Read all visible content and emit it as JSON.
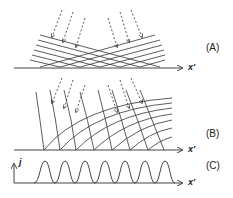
{
  "panels": [
    {
      "id": "A",
      "label": "(A)",
      "axis_label": "x'",
      "description": "Two families of straight crossing lines with incident dashed arrows"
    },
    {
      "id": "B",
      "label": "(B)",
      "axis_label": "x'",
      "description": "Curved wavefronts with incident dashed arrows"
    },
    {
      "id": "C",
      "label": "(C)",
      "axis_label": "x'",
      "y_axis_label": "j",
      "description": "Periodic profile of j along x' with seven peaks"
    }
  ],
  "colors": {
    "line": "#333333",
    "axis": "#444444",
    "background": "#ffffff"
  },
  "panel_c": {
    "peak_count": 7
  }
}
